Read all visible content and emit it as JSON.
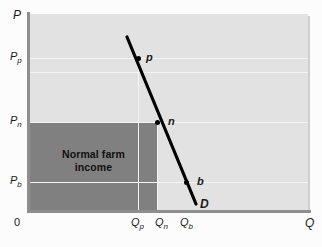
{
  "figure": {
    "type": "economics-supply-demand-diagram",
    "axes": {
      "y_label": "P",
      "x_label": "Q",
      "origin_label": "0"
    },
    "y_ticks": [
      {
        "id": "Pp",
        "base": "P",
        "sub": "p",
        "y_px": 58
      },
      {
        "id": "Pn",
        "base": "P",
        "sub": "n",
        "y_px": 122
      },
      {
        "id": "Pb",
        "base": "P",
        "sub": "b",
        "y_px": 182
      }
    ],
    "x_ticks": [
      {
        "id": "Qp",
        "base": "Q",
        "sub": "p",
        "x_px": 138
      },
      {
        "id": "Qn",
        "base": "Q",
        "sub": "n",
        "x_px": 157
      },
      {
        "id": "Qb",
        "base": "Q",
        "sub": "b",
        "x_px": 186
      }
    ],
    "shaded_region": {
      "name": "normal-farm-income",
      "line1": "Normal farm",
      "line2": "income",
      "color": "#808080"
    },
    "curve": {
      "label": "D",
      "name": "demand-curve",
      "color": "#000000",
      "points": [
        {
          "label": "p",
          "x_px": 138,
          "y_px": 58
        },
        {
          "label": "n",
          "x_px": 157,
          "y_px": 122
        },
        {
          "label": "b",
          "x_px": 186,
          "y_px": 182
        }
      ]
    },
    "colors": {
      "panel": "#e2e2e2",
      "gridline": "#f4f4f4",
      "axis": "#8e8e8e",
      "shade": "#808080",
      "curve": "#000000"
    }
  }
}
